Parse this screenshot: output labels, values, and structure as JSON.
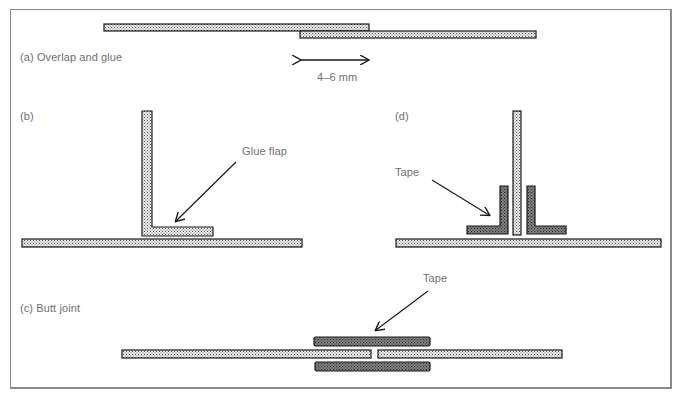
{
  "figure": {
    "panels": [
      {
        "id": "a",
        "caption": "(a)  Overlap and glue",
        "dimension_label": "4–6 mm"
      },
      {
        "id": "b",
        "caption": "(b)",
        "callout": "Glue flap"
      },
      {
        "id": "d",
        "caption": "(d)",
        "callout": "Tape"
      },
      {
        "id": "c",
        "caption": "(c)  Butt joint",
        "callout": "Tape"
      }
    ],
    "colors": {
      "frame": "#8a8a8a",
      "outline": "#1a1a1a",
      "board_fill": "#d8d8d8",
      "tape_fill": "#6a6a6a",
      "label_text": "#6f6f6f"
    }
  }
}
